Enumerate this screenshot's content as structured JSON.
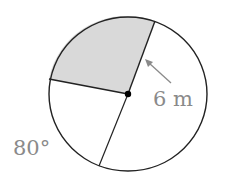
{
  "diagram": {
    "type": "circle-sector",
    "radius_label": "6 m",
    "angle_label": "80°",
    "colors": {
      "stroke": "#222222",
      "shaded": "#d9d9d9",
      "label": "#8a8a8a"
    }
  }
}
